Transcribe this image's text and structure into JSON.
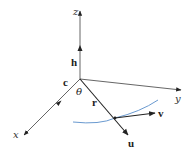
{
  "diagram": {
    "type": "3d-vector-diagram",
    "colors": {
      "axis": "#555555",
      "vector": "#222222",
      "curve": "#6a9ad0"
    },
    "axes": {
      "x": {
        "label": "x"
      },
      "y": {
        "label": "y"
      },
      "z": {
        "label": "z"
      }
    },
    "vectors": {
      "h": {
        "label": "h"
      },
      "c": {
        "label": "c"
      },
      "r": {
        "label": "r"
      },
      "u": {
        "label": "u"
      },
      "v": {
        "label": "v"
      }
    },
    "angle": {
      "label": "θ"
    }
  }
}
